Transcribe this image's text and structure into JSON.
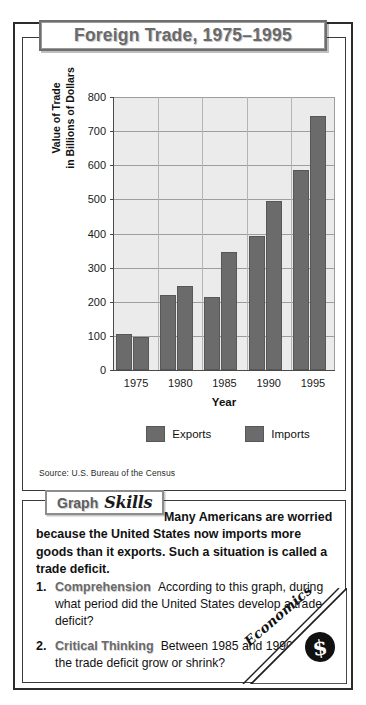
{
  "title": "Foreign Trade, 1975–1995",
  "source": "Source:  U.S. Bureau of the Census",
  "chart_data": {
    "type": "bar",
    "title": "Foreign Trade, 1975–1995",
    "xlabel": "Year",
    "ylabel": "Value of Trade\nin Billions of Dollars",
    "ylabel_line1": "Value of Trade",
    "ylabel_line2": "in Billions of Dollars",
    "categories": [
      "1975",
      "1980",
      "1985",
      "1990",
      "1995"
    ],
    "series": [
      {
        "name": "Exports",
        "values": [
          107,
          220,
          214,
          394,
          585
        ],
        "color": "#6b6b6b"
      },
      {
        "name": "Imports",
        "values": [
          98,
          245,
          345,
          495,
          745
        ],
        "color": "#6b6b6b"
      }
    ],
    "ylim": [
      0,
      800
    ],
    "yticks": [
      0,
      100,
      200,
      300,
      400,
      500,
      600,
      700,
      800
    ],
    "grid": true,
    "legend_position": "bottom",
    "source": "Source:  U.S. Bureau of the Census"
  },
  "skills": {
    "badge_word1": "Graph",
    "badge_word2": "Skills",
    "intro": "Many Americans are worried because the United States now imports more goods than it exports. Such a situation is called a trade deficit.",
    "questions": [
      {
        "number": "1.",
        "title": "Comprehension",
        "text": "According to this graph, during what period did the United States develop a trade deficit?"
      },
      {
        "number": "2.",
        "title": "Critical Thinking",
        "text": "Between 1985 and 1990, did the trade deficit grow or shrink?"
      }
    ]
  },
  "corner": {
    "label": "Economics",
    "icon": "$"
  }
}
